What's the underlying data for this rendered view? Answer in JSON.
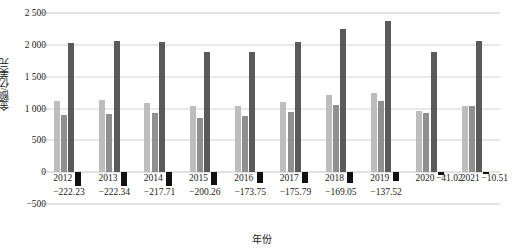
{
  "chart_data": {
    "type": "bar",
    "title": "",
    "xlabel": "年份",
    "ylabel": "金额/亿美元",
    "grid": true,
    "legend": "none",
    "ylim": [
      -500,
      2500
    ],
    "ytick_labels": [
      "2 500",
      "2 000",
      "1 500",
      "1 000",
      "500",
      "0",
      "-500"
    ],
    "ytick_values": [
      2500,
      2000,
      1500,
      1000,
      500,
      0,
      -500
    ],
    "categories": [
      "2012",
      "2013",
      "2014",
      "2015",
      "2016",
      "2017",
      "2018",
      "2019",
      "2020",
      "2021"
    ],
    "series": [
      {
        "name": "series-1",
        "color": "#bdbdbd",
        "values": [
          1120,
          1140,
          1090,
          1045,
          1035,
          1105,
          1205,
          1245,
          960,
          1040
        ]
      },
      {
        "name": "series-2",
        "color": "#8f8f8f",
        "values": [
          900,
          920,
          935,
          855,
          880,
          945,
          1050,
          1125,
          930,
          1040
        ]
      },
      {
        "name": "series-3",
        "color": "#5a5a5a",
        "values": [
          2025,
          2065,
          2050,
          1880,
          1890,
          2040,
          2255,
          2375,
          1890,
          2060
        ]
      },
      {
        "name": "series-4",
        "color": "#111111",
        "values": [
          -222.23,
          -222.34,
          -217.71,
          -200.26,
          -173.75,
          -175.79,
          -169.05,
          -137.52,
          -41.02,
          -10.51
        ]
      }
    ],
    "negative_labels": [
      "-222.23",
      "-222.34",
      "-217.71",
      "-200.26",
      "-173.75",
      "-175.79",
      "-169.05",
      "-137.52",
      "-41.02",
      "-10.51"
    ]
  }
}
